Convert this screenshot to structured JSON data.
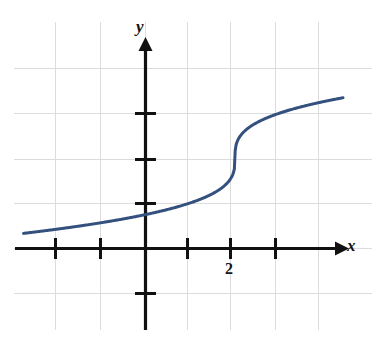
{
  "figure": {
    "width": 382,
    "height": 348,
    "background_color": "#ffffff"
  },
  "axes": {
    "x_axis_label": "x",
    "y_axis_label": "y",
    "axis_color": "#111111",
    "grid_color": "#d8d8d8",
    "origin_px": [
      145,
      248
    ],
    "unit_px": 45
  },
  "labels": {
    "tick_2": "2"
  },
  "chart_data": {
    "type": "line",
    "title": "",
    "subtitle": "",
    "xlabel": "x",
    "ylabel": "y",
    "grid": true,
    "legend": false,
    "legend_position": "none",
    "xlim": [
      -2.7,
      4.4
    ],
    "ylim": [
      -1.2,
      4.7
    ],
    "xticks": [
      -2,
      -1,
      1,
      2,
      3
    ],
    "xtick_labels": [
      "",
      "",
      "",
      "2",
      ""
    ],
    "yticks": [
      -1,
      1,
      2,
      3
    ],
    "ytick_labels": [
      "",
      "",
      "",
      ""
    ],
    "series": [
      {
        "name": "y = cbrt(x - 2) + 2",
        "color": "#33507e",
        "line_width": 3,
        "x": [
          -2.67,
          -2.4,
          -2.1,
          -1.8,
          -1.5,
          -1.2,
          -0.9,
          -0.6,
          -0.3,
          0.0,
          0.3,
          0.6,
          0.9,
          1.2,
          1.4,
          1.6,
          1.75,
          1.85,
          1.92,
          1.96,
          1.98,
          1.99,
          2.0,
          2.01,
          2.02,
          2.04,
          2.08,
          2.15,
          2.25,
          2.4,
          2.6,
          2.8,
          3.0,
          3.3,
          3.6,
          3.9,
          4.2,
          4.45
        ],
        "y": [
          0.33,
          0.44,
          0.56,
          0.66,
          0.74,
          0.82,
          0.89,
          0.96,
          1.02,
          1.74,
          1.79,
          1.85,
          1.9,
          1.95,
          1.96,
          1.97,
          1.98,
          1.99,
          1.99,
          2.0,
          2.0,
          2.0,
          2.0,
          2.0,
          2.0,
          2.01,
          2.02,
          2.05,
          2.1,
          2.16,
          2.25,
          2.33,
          2.4,
          2.5,
          2.58,
          2.66,
          2.73,
          2.79
        ]
      }
    ],
    "annotations": [
      {
        "text": "2",
        "x": 2,
        "y": -0.35,
        "role": "x-tick-label"
      },
      {
        "text": "x",
        "x": 4.5,
        "y": 0.25,
        "role": "axis-name"
      },
      {
        "text": "y",
        "x": 0.0,
        "y": 5.05,
        "role": "axis-name"
      }
    ]
  }
}
